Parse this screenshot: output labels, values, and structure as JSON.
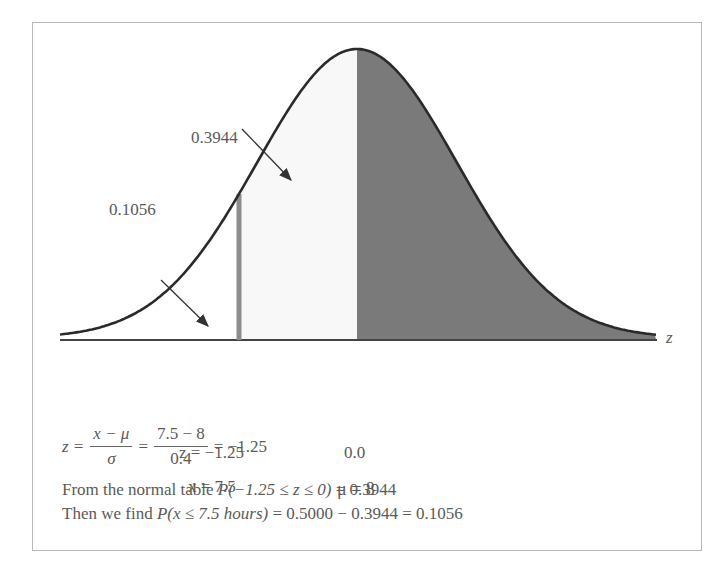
{
  "chart_data": {
    "type": "area",
    "title": "",
    "xlabel": "z",
    "ylabel": "",
    "distribution": {
      "mean": 8,
      "sd": 0.4
    },
    "regions": [
      {
        "name": "left-tail",
        "from_z": null,
        "to_z": -1.25,
        "area": 0.1056,
        "fill": "#ffffff"
      },
      {
        "name": "middle",
        "from_z": -1.25,
        "to_z": 0.0,
        "area": 0.3944,
        "fill": "#f7f7f7"
      },
      {
        "name": "right-half",
        "from_z": 0.0,
        "to_z": null,
        "area": 0.5,
        "fill": "#7a7a7a"
      }
    ],
    "annotations": [
      {
        "text": "0.3944",
        "points_to": "middle"
      },
      {
        "text": "0.1056",
        "points_to": "left-tail"
      }
    ],
    "tick_labels": [
      {
        "z": -1.25,
        "lines": [
          "z = −1.25",
          "x = 7.5"
        ]
      },
      {
        "z": 0.0,
        "lines": [
          "0.0",
          "μ = 8"
        ]
      }
    ],
    "grid": false,
    "legend": null
  },
  "labels": {
    "area_middle": "0.3944",
    "area_tail": "0.1056",
    "axis_var": "z",
    "tick_left_z": "z = −1.25",
    "tick_left_x": "x = 7.5",
    "tick_center_z": "0.0",
    "tick_center_mu": "μ = 8"
  },
  "formula": {
    "lhs": "z =",
    "frac1_num": "x − μ",
    "frac1_den": "σ",
    "eq1": "=",
    "frac2_num": "7.5 − 8",
    "frac2_den": "0.4",
    "result": "= −1.25"
  },
  "text_lines": {
    "line1_prefix": "From the normal table ",
    "line1_prob": "P(−1.25 ≤ z ≤ 0)",
    "line1_suffix": " = 0.3944",
    "line2_prefix": "Then we find ",
    "line2_prob": "P(x ≤ 7.5 hours)",
    "line2_suffix": " = 0.5000 − 0.3944 = 0.1056"
  },
  "colors": {
    "dark_fill": "#7a7a7a",
    "light_fill": "#f8f8f8",
    "cut_line": "#8c8c8c",
    "curve": "#2a2a2a"
  }
}
